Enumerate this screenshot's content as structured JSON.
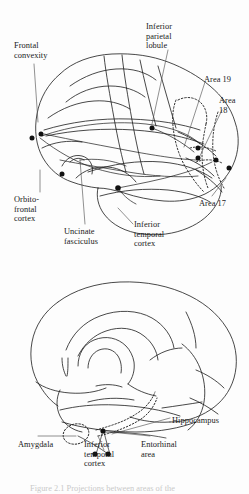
{
  "figure": {
    "domain": "anatomical-diagram",
    "background_color": "#fdfdfd",
    "stroke_color": "#1a1a1a",
    "marker_color": "#111111"
  },
  "lateral_view": {
    "name": "Lateral view of cerebral hemisphere",
    "labels": [
      {
        "id": "frontal-convexity",
        "text": "Frontal\nconvexity",
        "x": 14,
        "y": 41,
        "align": "left"
      },
      {
        "id": "inferior-parietal-lobule",
        "text": "Inferior\nparietal\nlobule",
        "x": 146,
        "y": 22,
        "align": "left"
      },
      {
        "id": "area-19",
        "text": "Area 19",
        "x": 204,
        "y": 75,
        "align": "left"
      },
      {
        "id": "area-18",
        "text": "Area\n18",
        "x": 221,
        "y": 96,
        "align": "left"
      },
      {
        "id": "area-17",
        "text": "Area 17",
        "x": 200,
        "y": 199,
        "align": "left"
      },
      {
        "id": "orbito-frontal-cortex",
        "text": "Orbito-\nfrontal\ncortex",
        "x": 14,
        "y": 195,
        "align": "left"
      },
      {
        "id": "uncinate-fasciculus",
        "text": "Uncinate\nfasciculus",
        "x": 66,
        "y": 227,
        "align": "left"
      },
      {
        "id": "inferior-temporal-cortex",
        "text": "Inferior\ntemporal\ncortex",
        "x": 134,
        "y": 220,
        "align": "left"
      }
    ]
  },
  "medial_view": {
    "name": "Medial view of cerebral hemisphere",
    "labels": [
      {
        "id": "hippocampus",
        "text": "Hippocampus",
        "x": 172,
        "y": 416,
        "align": "left"
      },
      {
        "id": "amygdala",
        "text": "Amygdala",
        "x": 18,
        "y": 440,
        "align": "left"
      },
      {
        "id": "inferior-temporal-cortex-medial",
        "text": "Inferior\ntemporal\ncortex",
        "x": 84,
        "y": 440,
        "align": "left"
      },
      {
        "id": "entorhinal-area",
        "text": "Entorhinal\narea",
        "x": 141,
        "y": 440,
        "align": "left"
      }
    ]
  },
  "caption": {
    "text": "Figure 2.1  Projections between areas of the"
  }
}
